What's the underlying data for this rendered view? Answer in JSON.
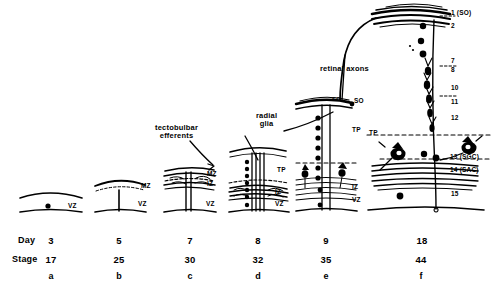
{
  "figure": {
    "type": "developmental-schematic"
  },
  "annotations": [
    {
      "id": "tectobulbar",
      "line1": "tectobulbar",
      "line2": "efferents",
      "x": 157,
      "y": 126
    },
    {
      "id": "radial-glia",
      "line1": "radial",
      "line2": "glia",
      "x": 256,
      "y": 114
    },
    {
      "id": "retinal-axons",
      "line1": "retinal axons",
      "line2": "",
      "x": 322,
      "y": 67
    }
  ],
  "axis_labels": {
    "day": "Day",
    "stage": "Stage"
  },
  "columns": [
    {
      "key": "a",
      "day": "3",
      "stage": "17",
      "letter": "a",
      "cx": 50,
      "zones": [
        {
          "t": "VZ",
          "x": 68,
          "y": 208
        }
      ]
    },
    {
      "key": "b",
      "day": "5",
      "stage": "25",
      "letter": "b",
      "cx": 119,
      "zones": [
        {
          "t": "MZ",
          "x": 141,
          "y": 188
        },
        {
          "t": "VZ",
          "x": 138,
          "y": 206
        }
      ]
    },
    {
      "key": "c",
      "day": "7",
      "stage": "30",
      "letter": "c",
      "cx": 190,
      "zones": [
        {
          "t": "MZ",
          "x": 207,
          "y": 176
        },
        {
          "t": "IZ",
          "x": 207,
          "y": 186
        },
        {
          "t": "VZ",
          "x": 206,
          "y": 206
        }
      ]
    },
    {
      "key": "d",
      "day": "8",
      "stage": "32",
      "letter": "d",
      "cx": 258,
      "zones": [
        {
          "t": "TP",
          "x": 277,
          "y": 172
        },
        {
          "t": "IZ",
          "x": 275,
          "y": 194
        },
        {
          "t": "VZ",
          "x": 275,
          "y": 206
        }
      ]
    },
    {
      "key": "e",
      "day": "9",
      "stage": "35",
      "letter": "e",
      "cx": 326,
      "zones": [
        {
          "t": "SO",
          "x": 352,
          "y": 103
        },
        {
          "t": "TP",
          "x": 352,
          "y": 131
        },
        {
          "t": "IZ",
          "x": 352,
          "y": 189
        },
        {
          "t": "VZ",
          "x": 352,
          "y": 202
        }
      ]
    },
    {
      "key": "f",
      "day": "18",
      "stage": "44",
      "letter": "f",
      "cx": 424,
      "zones": [
        {
          "t": "TP",
          "x": 372,
          "y": 135
        }
      ]
    }
  ],
  "tectum_layers": [
    {
      "label": "1 (SO)",
      "x": 451,
      "y": 14
    },
    {
      "label": "2",
      "x": 451,
      "y": 27
    },
    {
      "label": "7",
      "x": 451,
      "y": 62
    },
    {
      "label": "8",
      "x": 451,
      "y": 70
    },
    {
      "label": "10",
      "x": 451,
      "y": 89
    },
    {
      "label": "11",
      "x": 451,
      "y": 103
    },
    {
      "label": "12",
      "x": 451,
      "y": 119
    },
    {
      "label": "13 (SGC)",
      "x": 450,
      "y": 159
    },
    {
      "label": "14 (SAC)",
      "x": 450,
      "y": 172
    },
    {
      "label": "15",
      "x": 451,
      "y": 195
    }
  ],
  "small_marks": [
    {
      "label": "SO",
      "x": 343,
      "y": 99
    }
  ],
  "colors": {
    "ink": "#000000",
    "background": "#ffffff"
  }
}
